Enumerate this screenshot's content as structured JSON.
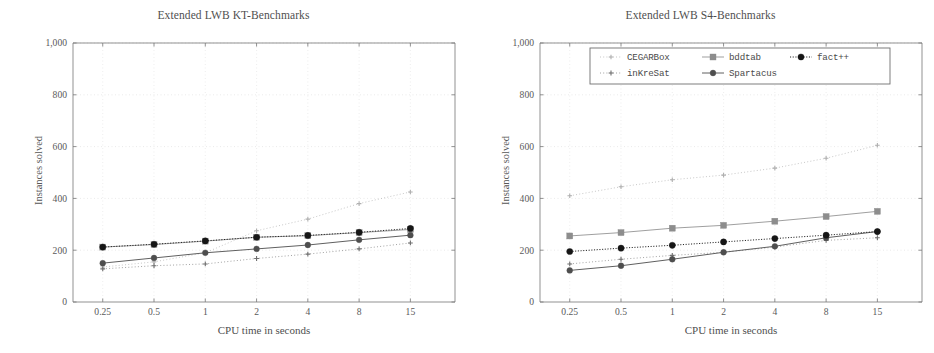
{
  "panels": [
    {
      "title": "Extended LWB KT-Benchmarks",
      "xlabel": "CPU time in seconds",
      "ylabel": "Instances solved",
      "has_legend": false
    },
    {
      "title": "Extended LWB S4-Benchmarks",
      "xlabel": "CPU time in seconds",
      "ylabel": "Instances solved",
      "has_legend": true
    }
  ],
  "legend": {
    "entries": [
      {
        "label": "CEGARBox",
        "marker": "plus",
        "color": "#b4b4b4",
        "dash": "dotted"
      },
      {
        "label": "bddtab",
        "marker": "square",
        "color": "#8a8a8a",
        "dash": "solid"
      },
      {
        "label": "fact++",
        "marker": "circle",
        "color": "#1a1a1a",
        "dash": "dashed"
      },
      {
        "label": "inKreSat",
        "marker": "plus",
        "color": "#6e6e6e",
        "dash": "dotted"
      },
      {
        "label": "Spartacus",
        "marker": "circle",
        "color": "#555555",
        "dash": "solid"
      }
    ]
  },
  "axis": {
    "x_ticks": [
      "0.25",
      "0.5",
      "1",
      "2",
      "4",
      "8",
      "15"
    ],
    "y_ticks": [
      "0",
      "200",
      "400",
      "600",
      "800",
      "1,000"
    ]
  },
  "chart_data": [
    {
      "type": "line",
      "title": "Extended LWB KT-Benchmarks",
      "xlabel": "CPU time in seconds",
      "ylabel": "Instances solved",
      "categories": [
        "0.25",
        "0.5",
        "1",
        "2",
        "4",
        "8",
        "15"
      ],
      "x": [
        0.25,
        0.5,
        1,
        2,
        4,
        8,
        15
      ],
      "xscale": "log2-categorical",
      "ylim": [
        0,
        1000
      ],
      "yticks": [
        0,
        200,
        400,
        600,
        800,
        1000
      ],
      "grid": true,
      "legend": "none",
      "series": [
        {
          "name": "CEGARBox",
          "values": [
            135,
            155,
            190,
            275,
            320,
            380,
            425
          ]
        },
        {
          "name": "bddtab",
          "values": [
            212,
            222,
            235,
            250,
            256,
            268,
            280
          ]
        },
        {
          "name": "fact++",
          "values": [
            212,
            223,
            236,
            250,
            257,
            269,
            284
          ]
        },
        {
          "name": "inKreSat",
          "values": [
            128,
            140,
            147,
            168,
            185,
            205,
            228
          ]
        },
        {
          "name": "Spartacus",
          "values": [
            150,
            170,
            190,
            205,
            220,
            240,
            258
          ]
        }
      ]
    },
    {
      "type": "line",
      "title": "Extended LWB S4-Benchmarks",
      "xlabel": "CPU time in seconds",
      "ylabel": "Instances solved",
      "categories": [
        "0.25",
        "0.5",
        "1",
        "2",
        "4",
        "8",
        "15"
      ],
      "x": [
        0.25,
        0.5,
        1,
        2,
        4,
        8,
        15
      ],
      "xscale": "log2-categorical",
      "ylim": [
        0,
        1000
      ],
      "yticks": [
        0,
        200,
        400,
        600,
        800,
        1000
      ],
      "grid": true,
      "legend": "upper left (inside axes, 2 rows)",
      "series": [
        {
          "name": "CEGARBox",
          "values": [
            410,
            445,
            472,
            490,
            517,
            555,
            605
          ]
        },
        {
          "name": "bddtab",
          "values": [
            255,
            268,
            285,
            296,
            312,
            330,
            350
          ]
        },
        {
          "name": "fact++",
          "values": [
            195,
            208,
            219,
            232,
            245,
            258,
            272
          ]
        },
        {
          "name": "inKreSat",
          "values": [
            147,
            165,
            180,
            192,
            212,
            238,
            248
          ]
        },
        {
          "name": "Spartacus",
          "values": [
            122,
            140,
            165,
            192,
            215,
            248,
            272
          ]
        }
      ]
    }
  ]
}
